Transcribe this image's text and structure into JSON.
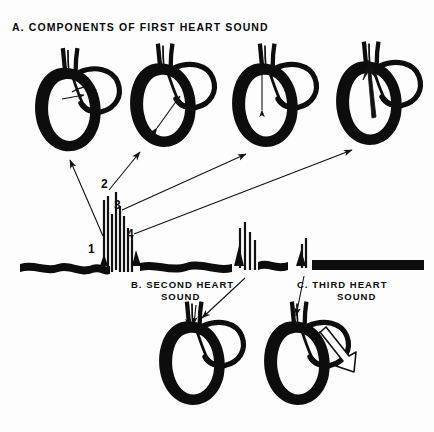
{
  "figure": {
    "background_color": "#fdfdfd",
    "ink_color": "#0d0d0d",
    "width": 434,
    "height": 432
  },
  "sections": {
    "a": {
      "id": "A.",
      "title": "A. COMPONENTS OF FIRST HEART SOUND",
      "title_line": "A. COMPONENTS OF FIRST HEART SOUND"
    },
    "b": {
      "id": "B.",
      "line1": "B. SECOND   HEART",
      "line2": "SOUND",
      "full": "B. SECOND HEART SOUND"
    },
    "c": {
      "id": "C.",
      "line1": "C.  THIRD   HEART",
      "line2": "SOUND",
      "full": "C. THIRD HEART SOUND"
    }
  },
  "components": {
    "labels": [
      "1",
      "2",
      "3",
      "4"
    ],
    "label_1": "1",
    "label_2": "2",
    "label_3": "3",
    "label_4": "4"
  },
  "hearts": {
    "top": [
      {
        "name": "heart-component-1",
        "marker": "arrow-small-right"
      },
      {
        "name": "heart-component-2",
        "marker": "arrow-double-diagonal"
      },
      {
        "name": "heart-component-3",
        "marker": "arrow-double-vertical"
      },
      {
        "name": "heart-component-4",
        "marker": "arrow-up-outflow"
      }
    ],
    "bottom": [
      {
        "name": "heart-second-sound",
        "marker": "arrows-down-pair"
      },
      {
        "name": "heart-third-sound",
        "marker": "arrow-hollow-down-right"
      }
    ]
  },
  "trace": {
    "name": "phonocardiogram-trace",
    "s1_cluster_label": "1",
    "s2_cluster_label": "2",
    "s3_spike_label": "3"
  },
  "connectors": {
    "items": [
      {
        "from": "1",
        "to": "heart-component-1"
      },
      {
        "from": "2",
        "to": "heart-component-2"
      },
      {
        "from": "3",
        "to": "heart-component-3"
      },
      {
        "from": "4",
        "to": "heart-component-4"
      },
      {
        "from": "second-sound-spikes",
        "to": "heart-second-sound"
      },
      {
        "from": "third-sound-spike",
        "to": "heart-third-sound"
      }
    ]
  }
}
